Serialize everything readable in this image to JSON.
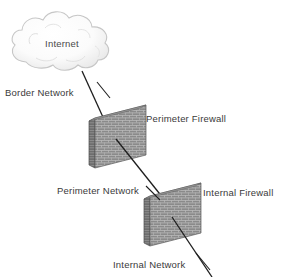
{
  "diagram": {
    "background_color": "#ffffff",
    "label_color": "#3a3a3a",
    "line_color": "#1e1e1e",
    "wall_face_color": "#8a8a8a",
    "wall_side_color": "#6e6e6e",
    "wall_mortar_color": "#bdbdbd",
    "cloud_fill_color": "#fdfdfd",
    "cloud_outline_color": "#c8c8c8",
    "nodes": {
      "internet_cloud": {
        "label": "Internet",
        "icon": "cloud-icon",
        "cx": 62,
        "cy": 44
      },
      "perimeter_firewall": {
        "label": "Perimeter Firewall",
        "icon": "brick-wall-icon",
        "cx": 116,
        "cy": 140
      },
      "internal_firewall": {
        "label": "Internal Firewall",
        "icon": "brick-wall-icon",
        "cx": 172,
        "cy": 218
      }
    },
    "links": {
      "border_network": {
        "label": "Border Network",
        "from": "internet_cloud",
        "to": "perimeter_firewall"
      },
      "perimeter_network": {
        "label": "Perimeter Network",
        "from": "perimeter_firewall",
        "to": "internal_firewall"
      },
      "internal_network": {
        "label": "Internal Network",
        "from": "internal_firewall",
        "to": "internal-hosts"
      }
    }
  }
}
